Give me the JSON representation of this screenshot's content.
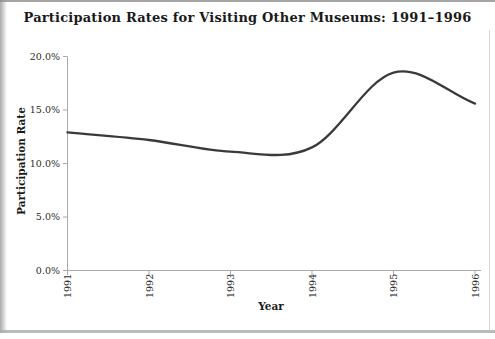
{
  "chart_data": {
    "type": "line",
    "smoothed": true,
    "title": "Participation Rates for Visiting Other Museums: 1991–1996",
    "xlabel": "Year",
    "ylabel": "Participation Rate",
    "x": [
      1991,
      1992,
      1993,
      1994,
      1995,
      1996
    ],
    "values": [
      12.9,
      12.2,
      11.1,
      11.5,
      18.5,
      15.6
    ],
    "unit": "%",
    "ylim": [
      0,
      20
    ],
    "y_tick_values": [
      0,
      5,
      10,
      15,
      20
    ],
    "y_tick_labels": [
      "0.0%",
      "5.0%",
      "10.0%",
      "15.0%",
      "20.0%"
    ],
    "x_tick_labels": [
      "1991",
      "1992",
      "1993",
      "1994",
      "1995",
      "1996"
    ],
    "grid": false,
    "legend": false
  },
  "style": {
    "line_color": "#3a3a3a",
    "axis_color": "#a9a9a9",
    "tick_text_color": "#2a2a2a",
    "title_text_color": "#1a1a1a",
    "background": "#ffffff"
  }
}
